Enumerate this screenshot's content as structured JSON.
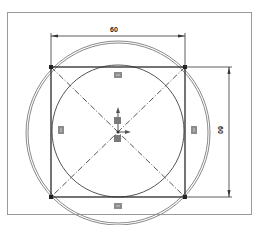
{
  "drawing": {
    "title": "Sketch: square inscribed in circle",
    "frame": {
      "x": 7,
      "y": 12,
      "width": 244,
      "height": 202,
      "stroke": "#9a9a9a"
    },
    "square": {
      "x": 51,
      "y": 67,
      "size": 134,
      "stroke": "#2a2a2a"
    },
    "inner_circle": {
      "cx": 118,
      "cy": 132,
      "r": 67,
      "stroke": "#5a5a5a"
    },
    "outer_circle": {
      "cx": 118,
      "cy": 133,
      "r": 91,
      "stroke": "#7a7a7a"
    },
    "dimensions": {
      "horizontal": {
        "value": "60",
        "y": 35
      },
      "vertical": {
        "value": "60",
        "x": 228
      }
    },
    "constraint_markers": [
      {
        "name": "top",
        "x": 118,
        "y": 75
      },
      {
        "name": "bottom",
        "x": 118,
        "y": 206
      },
      {
        "name": "left",
        "x": 61,
        "y": 130
      },
      {
        "name": "right",
        "x": 194,
        "y": 130
      }
    ],
    "colors": {
      "line": "#2a2a2a",
      "construction": "#444444",
      "marker": "#8c8c8c",
      "background": "#ffffff"
    }
  }
}
